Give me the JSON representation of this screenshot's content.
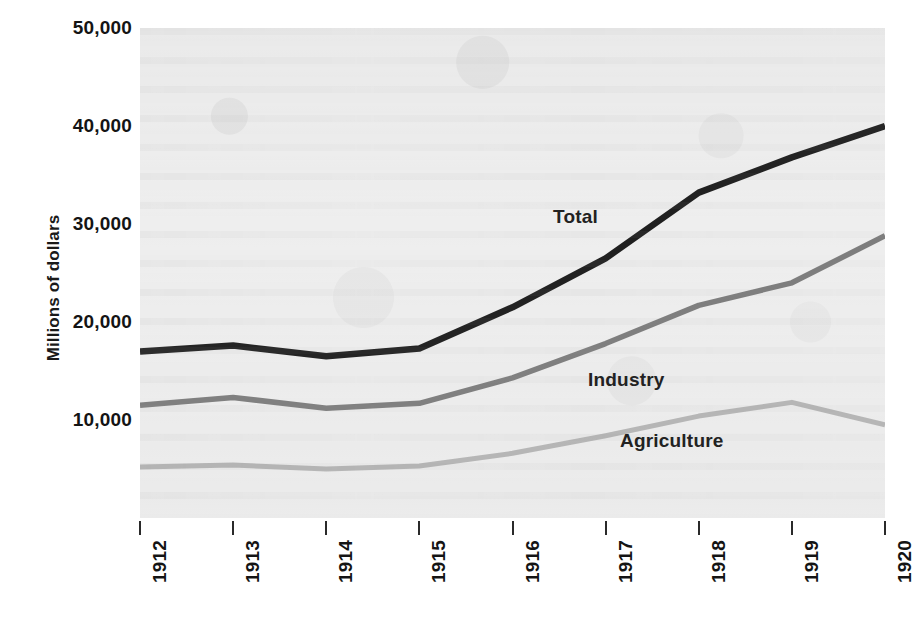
{
  "chart_data": {
    "type": "line",
    "title": "",
    "subtitle": "",
    "xlabel": "",
    "ylabel": "Millions of dollars",
    "x": [
      1912,
      1913,
      1914,
      1915,
      1916,
      1917,
      1918,
      1919,
      1920
    ],
    "categories": [
      "1912",
      "1913",
      "1914",
      "1915",
      "1916",
      "1917",
      "1918",
      "1919",
      "1920"
    ],
    "xlim": [
      1912,
      1920
    ],
    "ylim": [
      0,
      50000
    ],
    "ytick_values": [
      10000,
      20000,
      30000,
      40000,
      50000
    ],
    "ytick_labels": [
      "10,000",
      "20,000",
      "30,000",
      "40,000",
      "50,000"
    ],
    "grid": false,
    "legend_position": "inline-annotations",
    "series": [
      {
        "name": "Total",
        "color": "#1a1a1a",
        "values": [
          17000,
          17600,
          16500,
          17300,
          21500,
          26500,
          33200,
          36800,
          40000
        ]
      },
      {
        "name": "Industry",
        "color": "#7a7a7a",
        "values": [
          11500,
          12300,
          11200,
          11700,
          14300,
          17800,
          21700,
          24000,
          28800
        ]
      },
      {
        "name": "Agriculture",
        "color": "#b4b4b4",
        "values": [
          5200,
          5400,
          5000,
          5300,
          6600,
          8400,
          10400,
          11800,
          9500
        ]
      }
    ],
    "annotations": [
      {
        "text": "Total",
        "series": "Total"
      },
      {
        "text": "Industry",
        "series": "Industry"
      },
      {
        "text": "Agriculture",
        "series": "Agriculture"
      }
    ]
  },
  "axis": {
    "y_title": "Millions of dollars"
  },
  "colors": {
    "plot_background": "#eeeeee",
    "page_background": "#ffffff",
    "axis_text": "#141414",
    "total": "#1a1a1a",
    "industry": "#7a7a7a",
    "agriculture": "#b4b4b4"
  }
}
